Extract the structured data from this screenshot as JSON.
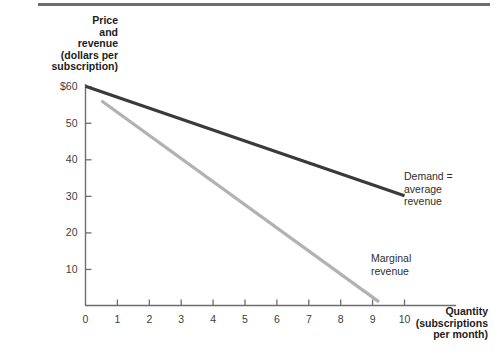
{
  "figure": {
    "background_color": "#ffffff",
    "rule_color": "#6e6e6e"
  },
  "axes": {
    "y_title": "Price\nand\nrevenue\n(dollars per\nsubscription)",
    "x_title": "Quantity\n(subscriptions\nper month)",
    "y_ticks": [
      {
        "label": "$60",
        "value": 60
      },
      {
        "label": "50",
        "value": 50
      },
      {
        "label": "40",
        "value": 40
      },
      {
        "label": "30",
        "value": 30
      },
      {
        "label": "20",
        "value": 20
      },
      {
        "label": "10",
        "value": 10
      }
    ],
    "x_ticks": [
      {
        "label": "0",
        "value": 0
      },
      {
        "label": "1",
        "value": 1
      },
      {
        "label": "2",
        "value": 2
      },
      {
        "label": "3",
        "value": 3
      },
      {
        "label": "4",
        "value": 4
      },
      {
        "label": "5",
        "value": 5
      },
      {
        "label": "6",
        "value": 6
      },
      {
        "label": "7",
        "value": 7
      },
      {
        "label": "8",
        "value": 8
      },
      {
        "label": "9",
        "value": 9
      },
      {
        "label": "10",
        "value": 10
      }
    ]
  },
  "labels": {
    "demand": "Demand =\naverage\nrevenue",
    "marginal_revenue": "Marginal\nrevenue"
  },
  "chart_data": {
    "type": "line",
    "title": "",
    "subtitle": "",
    "xlabel": "Quantity (subscriptions per month)",
    "ylabel": "Price and revenue (dollars per subscription)",
    "xlim": [
      0,
      11.6
    ],
    "ylim": [
      0,
      64.5
    ],
    "grid": false,
    "legend": "inline-annotations",
    "xticks": [
      0,
      1,
      2,
      3,
      4,
      5,
      6,
      7,
      8,
      9,
      10
    ],
    "xticklabels": [
      "0",
      "1",
      "2",
      "3",
      "4",
      "5",
      "6",
      "7",
      "8",
      "9",
      "10"
    ],
    "yticks": [
      10,
      20,
      30,
      40,
      50,
      60
    ],
    "yticklabels": [
      "10",
      "20",
      "30",
      "40",
      "50",
      "$60"
    ],
    "series": [
      {
        "name": "Demand = average revenue",
        "color": "#3a3a3a",
        "width": 3.2,
        "x": [
          0,
          10
        ],
        "y": [
          60,
          30
        ]
      },
      {
        "name": "Marginal revenue",
        "color": "#b2b2b2",
        "width": 3.2,
        "x": [
          0.5,
          9.2
        ],
        "y": [
          56,
          1
        ]
      }
    ],
    "annotations": [
      {
        "text": "Demand = average revenue",
        "x": 10.0,
        "y": 34
      },
      {
        "text": "Marginal revenue",
        "x": 9.0,
        "y": 16
      }
    ]
  }
}
